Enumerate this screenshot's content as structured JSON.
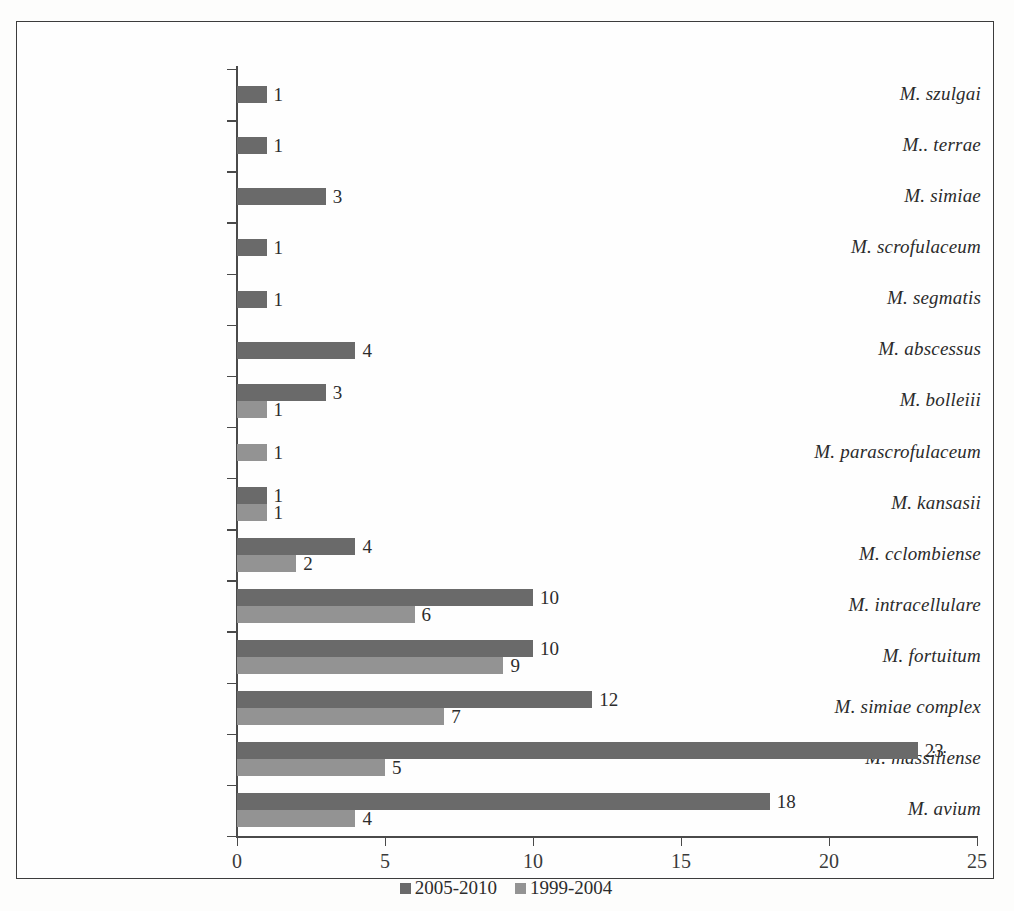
{
  "chart_data": {
    "type": "bar",
    "orientation": "horizontal",
    "title": "",
    "xlabel": "",
    "ylabel": "",
    "xlim": [
      0,
      25
    ],
    "xticks": [
      0,
      5,
      10,
      15,
      20,
      25
    ],
    "grid": false,
    "legend_position": "bottom-center",
    "categories": [
      "M. szulgai",
      "M.. terrae",
      "M. simiae",
      "M. scrofulaceum",
      "M. segmatis",
      "M. abscessus",
      "M. bolleiii",
      "M. parascrofulaceum",
      "M. kansasii",
      "M. cclombiense",
      "M. intracellulare",
      "M. fortuitum",
      "M. simiae complex",
      "M. massiliense",
      "M. avium"
    ],
    "series": [
      {
        "name": "2005-2010",
        "color": "#6a6a6a",
        "values": [
          1,
          1,
          3,
          1,
          1,
          4,
          3,
          null,
          1,
          4,
          10,
          10,
          12,
          23,
          18
        ]
      },
      {
        "name": "1999-2004",
        "color": "#939393",
        "values": [
          null,
          null,
          null,
          null,
          null,
          null,
          1,
          1,
          1,
          2,
          6,
          9,
          7,
          5,
          4
        ]
      }
    ]
  },
  "legend": {
    "items": [
      {
        "label": "2005-2010",
        "color": "#6a6a6a"
      },
      {
        "label": "1999-2004",
        "color": "#939393"
      }
    ]
  }
}
